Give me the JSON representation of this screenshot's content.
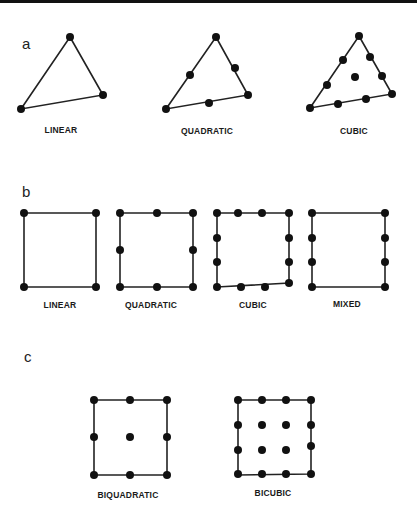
{
  "figure": {
    "top_bar_color": "#111111",
    "stroke_color": "#222222",
    "node_color": "#111111",
    "node_radius": 4,
    "panels": [
      {
        "letter": "a",
        "letter_pos": [
          22,
          49
        ],
        "elements": [
          {
            "label": "LINEAR",
            "label_pos": [
              61,
              133
            ],
            "shape": "polygon",
            "vertices": [
              [
                70,
                37
              ],
              [
                103,
                95
              ],
              [
                21,
                109
              ]
            ],
            "nodes": [
              [
                70,
                37
              ],
              [
                103,
                95
              ],
              [
                21,
                109
              ]
            ]
          },
          {
            "label": "QUADRATIC",
            "label_pos": [
              207,
              134
            ],
            "shape": "polygon",
            "vertices": [
              [
                216,
                37
              ],
              [
                248,
                95
              ],
              [
                166,
                109
              ]
            ],
            "nodes": [
              [
                216,
                37
              ],
              [
                248,
                95
              ],
              [
                166,
                109
              ],
              [
                190,
                75
              ],
              [
                235,
                68
              ],
              [
                209,
                103
              ]
            ]
          },
          {
            "label": "CUBIC",
            "label_pos": [
              354,
              134
            ],
            "shape": "polygon",
            "vertices": [
              [
                359,
                36
              ],
              [
                392,
                94
              ],
              [
                310,
                108
              ]
            ],
            "nodes": [
              [
                359,
                36
              ],
              [
                392,
                94
              ],
              [
                310,
                108
              ],
              [
                343,
                60
              ],
              [
                327,
                85
              ],
              [
                370,
                57
              ],
              [
                382,
                76
              ],
              [
                338,
                104
              ],
              [
                366,
                99
              ],
              [
                355,
                77
              ]
            ]
          }
        ]
      },
      {
        "letter": "b",
        "letter_pos": [
          22,
          197
        ],
        "elements": [
          {
            "label": "LINEAR",
            "label_pos": [
              60,
              308
            ],
            "shape": "polygon",
            "vertices": [
              [
                24,
                213
              ],
              [
                96,
                213
              ],
              [
                96,
                287
              ],
              [
                24,
                287
              ]
            ],
            "nodes": [
              [
                24,
                213
              ],
              [
                96,
                213
              ],
              [
                96,
                287
              ],
              [
                24,
                287
              ]
            ]
          },
          {
            "label": "QUADRATIC",
            "label_pos": [
              151,
              308
            ],
            "shape": "polygon",
            "vertices": [
              [
                120,
                213
              ],
              [
                193,
                213
              ],
              [
                193,
                287
              ],
              [
                120,
                287
              ]
            ],
            "nodes": [
              [
                120,
                213
              ],
              [
                157,
                213
              ],
              [
                193,
                213
              ],
              [
                193,
                250
              ],
              [
                193,
                287
              ],
              [
                157,
                287
              ],
              [
                120,
                287
              ],
              [
                120,
                250
              ]
            ]
          },
          {
            "label": "CUBIC",
            "label_pos": [
              253,
              308
            ],
            "shape": "polygon",
            "vertices": [
              [
                217,
                213
              ],
              [
                289,
                213
              ],
              [
                289,
                283
              ],
              [
                217,
                287
              ]
            ],
            "nodes": [
              [
                217,
                213
              ],
              [
                238,
                213
              ],
              [
                262,
                213
              ],
              [
                289,
                213
              ],
              [
                289,
                238
              ],
              [
                289,
                262
              ],
              [
                289,
                283
              ],
              [
                265,
                287
              ],
              [
                241,
                287
              ],
              [
                217,
                287
              ],
              [
                217,
                262
              ],
              [
                217,
                238
              ]
            ]
          },
          {
            "label": "MIXED",
            "label_pos": [
              347,
              307
            ],
            "shape": "polygon",
            "vertices": [
              [
                312,
                213
              ],
              [
                385,
                213
              ],
              [
                385,
                287
              ],
              [
                312,
                287
              ]
            ],
            "nodes": [
              [
                312,
                213
              ],
              [
                385,
                213
              ],
              [
                385,
                238
              ],
              [
                385,
                262
              ],
              [
                385,
                287
              ],
              [
                312,
                287
              ],
              [
                312,
                262
              ],
              [
                312,
                238
              ]
            ]
          }
        ]
      },
      {
        "letter": "c",
        "letter_pos": [
          24,
          362
        ],
        "elements": [
          {
            "label": "BIQUADRATIC",
            "label_pos": [
              128,
              498
            ],
            "shape": "polygon",
            "vertices": [
              [
                94,
                400
              ],
              [
                167,
                400
              ],
              [
                167,
                475
              ],
              [
                94,
                475
              ]
            ],
            "nodes": [
              [
                94,
                400
              ],
              [
                130,
                400
              ],
              [
                167,
                400
              ],
              [
                94,
                437
              ],
              [
                130,
                437
              ],
              [
                167,
                437
              ],
              [
                94,
                475
              ],
              [
                130,
                475
              ],
              [
                167,
                475
              ]
            ]
          },
          {
            "label": "BICUBIC",
            "label_pos": [
              273,
              496
            ],
            "shape": "polygon",
            "vertices": [
              [
                238,
                400
              ],
              [
                311,
                400
              ],
              [
                311,
                474
              ],
              [
                238,
                475
              ]
            ],
            "nodes": [
              [
                238,
                400
              ],
              [
                262,
                400
              ],
              [
                286,
                400
              ],
              [
                311,
                400
              ],
              [
                238,
                425
              ],
              [
                262,
                425
              ],
              [
                286,
                425
              ],
              [
                311,
                425
              ],
              [
                238,
                450
              ],
              [
                262,
                450
              ],
              [
                286,
                450
              ],
              [
                311,
                446
              ],
              [
                238,
                474
              ],
              [
                262,
                474
              ],
              [
                286,
                474
              ],
              [
                311,
                474
              ]
            ]
          }
        ]
      }
    ]
  }
}
